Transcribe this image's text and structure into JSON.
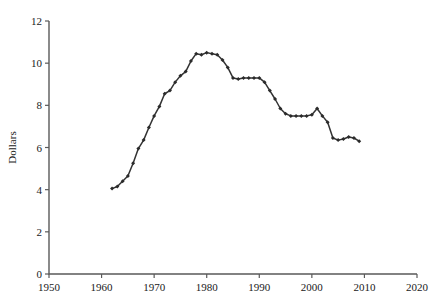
{
  "chart_data": {
    "type": "line",
    "title": "",
    "subtitle": "",
    "xlabel": "",
    "ylabel": "Dollars",
    "xlim": [
      1950,
      2020
    ],
    "ylim": [
      0,
      12
    ],
    "xticks": [
      1950,
      1960,
      1970,
      1980,
      1990,
      2000,
      2010,
      2020
    ],
    "yticks": [
      0,
      2,
      4,
      6,
      8,
      10,
      12
    ],
    "xtick_labels": [
      "1950",
      "1960",
      "1970",
      "1980",
      "1990",
      "2000",
      "2010",
      "2020"
    ],
    "ytick_labels": [
      "0",
      "2",
      "4",
      "6",
      "8",
      "10",
      "12"
    ],
    "grid": false,
    "legend": null,
    "legend_position": "none",
    "marker": "diamond",
    "line_color": "#333333",
    "marker_color": "#2b2b2b",
    "axis_color": "#5a5a5a",
    "background_color": "#ffffff",
    "series": [
      {
        "name": "Dollars",
        "x": [
          1962,
          1963,
          1964,
          1965,
          1966,
          1967,
          1968,
          1969,
          1970,
          1971,
          1972,
          1973,
          1974,
          1975,
          1976,
          1977,
          1978,
          1979,
          1980,
          1981,
          1982,
          1983,
          1984,
          1985,
          1986,
          1987,
          1988,
          1989,
          1990,
          1991,
          1992,
          1993,
          1994,
          1995,
          1996,
          1997,
          1998,
          1999,
          2000,
          2001,
          2002,
          2003,
          2004,
          2005,
          2006,
          2007,
          2008,
          2009
        ],
        "values": [
          4.05,
          4.15,
          4.4,
          4.65,
          5.25,
          5.95,
          6.35,
          6.95,
          7.5,
          7.95,
          8.55,
          8.7,
          9.1,
          9.4,
          9.6,
          10.1,
          10.45,
          10.4,
          10.5,
          10.45,
          10.4,
          10.15,
          9.8,
          9.3,
          9.25,
          9.3,
          9.3,
          9.3,
          9.3,
          9.1,
          8.7,
          8.3,
          7.85,
          7.6,
          7.5,
          7.5,
          7.5,
          7.5,
          7.55,
          7.85,
          7.5,
          7.2,
          6.45,
          6.35,
          6.4,
          6.5,
          6.45,
          6.3
        ]
      }
    ]
  }
}
